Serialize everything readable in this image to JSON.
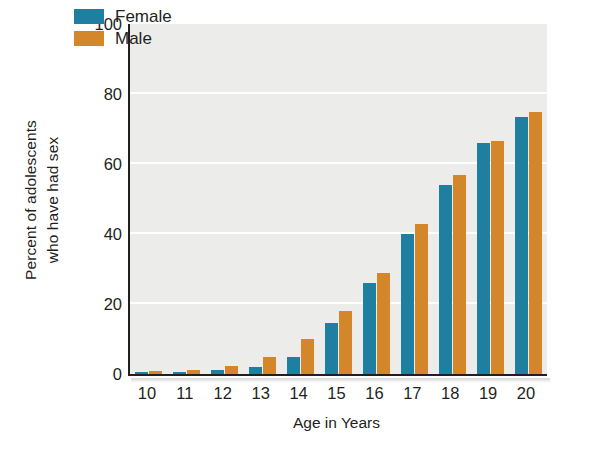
{
  "chart_data": {
    "type": "bar",
    "title": "",
    "subtitle": "",
    "xlabel": "Age in Years",
    "ylabel_line1": "Percent of adolescents",
    "ylabel_line2": "who have had sex",
    "categories": [
      "10",
      "11",
      "12",
      "13",
      "14",
      "15",
      "16",
      "17",
      "18",
      "19",
      "20"
    ],
    "series": [
      {
        "name": "Female",
        "color": "#1f7fa0",
        "values": [
          0.5,
          0.7,
          1.2,
          2.0,
          5.0,
          14.5,
          26.0,
          40.0,
          54.0,
          66.0,
          73.5
        ]
      },
      {
        "name": "Male",
        "color": "#d4862b",
        "values": [
          1.0,
          1.2,
          2.2,
          5.0,
          10.0,
          18.0,
          29.0,
          43.0,
          57.0,
          66.5,
          75.0
        ]
      }
    ],
    "ylim": [
      0,
      100
    ],
    "yticks": [
      0,
      20,
      40,
      60,
      80,
      100
    ],
    "ytick_labels": [
      "0",
      "20",
      "40",
      "60",
      "80",
      "100"
    ],
    "grid": "horizontal-white",
    "legend_position": "top-left-inside",
    "plot_background": "#ececeb",
    "axis_color": "#231f20"
  },
  "legend": {
    "items": [
      {
        "label": "Female",
        "color": "#1f7fa0"
      },
      {
        "label": "Male",
        "color": "#d4862b"
      }
    ]
  }
}
